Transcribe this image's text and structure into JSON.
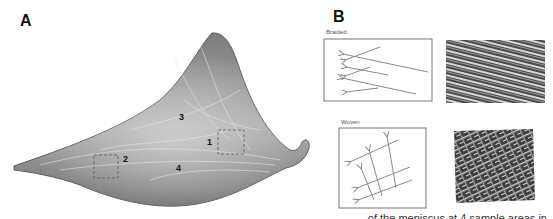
{
  "figure": {
    "panel_a": {
      "letter": "A",
      "subject": "meniscus cross-section photograph",
      "regions": [
        {
          "label": "1"
        },
        {
          "label": "2"
        },
        {
          "label": "3"
        },
        {
          "label": "4"
        }
      ]
    },
    "panel_b": {
      "letter": "B",
      "diagrams": [
        {
          "label": "Braided",
          "pattern": "braided-fibers-arrows"
        },
        {
          "label": "Woven",
          "pattern": "woven-fibers-arrows"
        }
      ],
      "micrographs": [
        {
          "name": "braided-micrograph"
        },
        {
          "name": "woven-micrograph"
        }
      ]
    },
    "caption_fragment": "… of the meniscus at 4 sample areas in"
  },
  "colors": {
    "tissue_dark": "#6e6e6e",
    "tissue_light": "#bdbdbd",
    "arrow": "#8a8a8a",
    "box_border": "#555555"
  }
}
